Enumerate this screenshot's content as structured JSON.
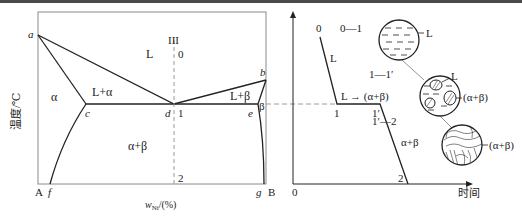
{
  "left_diagram": {
    "y_axis_label": "温度/℃",
    "x_axis_label_prefix": "w",
    "x_axis_label_sub": "Ni",
    "x_axis_label_suffix": "/(%)",
    "corner_left": "A",
    "corner_right": "B",
    "points": {
      "a": "a",
      "b": "b",
      "c": "c",
      "d": "d",
      "e": "e",
      "f": "f",
      "g": "g"
    },
    "regions": {
      "liquid": "L",
      "alpha": "α",
      "l_alpha": "L+α",
      "l_beta": "L+β",
      "beta": "β",
      "alpha_beta": "α+β"
    },
    "alloy_line": {
      "label": "III",
      "p0": "0",
      "p1": "1",
      "p2": "2"
    }
  },
  "right_diagram": {
    "x_axis_label": "时间",
    "origin": "0",
    "curve_points": {
      "p0": "0",
      "p1": "1",
      "p1prime": "1′",
      "p2": "2"
    },
    "segment_labels": {
      "liquid": "L",
      "reaction": "L → (α+β)",
      "solid": "α+β"
    },
    "stages": [
      {
        "range": "0—1",
        "label": "L"
      },
      {
        "range": "1—1′",
        "label_top": "L",
        "label_right": "(α+β)"
      },
      {
        "range": "1′—2",
        "label": "(α+β)"
      }
    ]
  },
  "colors": {
    "line": "#222222",
    "dashed": "#9a9a9a",
    "frame": "#8a8a8a"
  }
}
